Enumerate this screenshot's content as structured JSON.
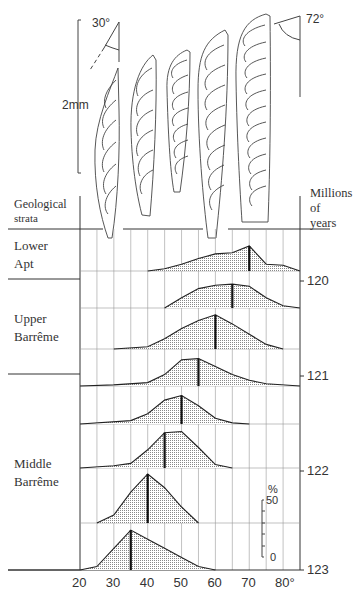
{
  "figure": {
    "scale_bar_label": "2mm",
    "angle_left_label": "30°",
    "angle_right_label": "72°",
    "left_header": [
      "Geological",
      "strata"
    ],
    "right_header": [
      "Millions",
      "of",
      "years"
    ],
    "strata": [
      {
        "name": [
          "Lower",
          "Apt"
        ]
      },
      {
        "name": [
          "Upper",
          "Barrême"
        ]
      },
      {
        "name": [
          "Middle",
          "Barrême"
        ]
      }
    ],
    "shell_count": 5
  },
  "chart_data": {
    "type": "area",
    "title": "",
    "xlabel": "Apical angle (degrees)",
    "ylabel": "Millions of years",
    "x_ticks": [
      "20",
      "30",
      "40",
      "50",
      "60",
      "70",
      "80°"
    ],
    "x_range": [
      20,
      85
    ],
    "grid": true,
    "time_ticks": [
      "120",
      "121",
      "122",
      "123"
    ],
    "percent_scale": {
      "unit": "%",
      "max_label": "50",
      "min_label": "0",
      "max": 50
    },
    "rows": [
      {
        "stratum": "Lower Apt",
        "mean": 70,
        "x": [
          40,
          45,
          50,
          55,
          60,
          65,
          70,
          75,
          80,
          85
        ],
        "pct": [
          0,
          2,
          6,
          11,
          15,
          16,
          22,
          6,
          5,
          0
        ]
      },
      {
        "stratum": "Upper Barrême",
        "mean": 65,
        "x": [
          45,
          50,
          55,
          60,
          65,
          70,
          75,
          80,
          85
        ],
        "pct": [
          0,
          9,
          17,
          20,
          21,
          19,
          9,
          2,
          0
        ]
      },
      {
        "stratum": "Upper Barrême",
        "mean": 60,
        "x": [
          30,
          40,
          45,
          50,
          55,
          60,
          65,
          70,
          75,
          80
        ],
        "pct": [
          0,
          2,
          9,
          18,
          25,
          30,
          22,
          13,
          4,
          0
        ]
      },
      {
        "stratum": "Upper Barrême",
        "mean": 55,
        "x": [
          20,
          30,
          40,
          45,
          50,
          55,
          60,
          65,
          70,
          75,
          85
        ],
        "pct": [
          0,
          1,
          3,
          10,
          23,
          24,
          17,
          10,
          5,
          2,
          0
        ]
      },
      {
        "stratum": "Middle Barrême",
        "mean": 50,
        "x": [
          20,
          35,
          40,
          45,
          50,
          55,
          60,
          65,
          70
        ],
        "pct": [
          0,
          3,
          9,
          21,
          25,
          16,
          5,
          1,
          0
        ]
      },
      {
        "stratum": "Middle Barrême",
        "mean": 45,
        "x": [
          20,
          30,
          35,
          40,
          45,
          50,
          55,
          60,
          65
        ],
        "pct": [
          0,
          2,
          4,
          16,
          31,
          32,
          18,
          3,
          0
        ]
      },
      {
        "stratum": "Middle Barrême",
        "mean": 40,
        "x": [
          25,
          30,
          35,
          40,
          45,
          50,
          55
        ],
        "pct": [
          0,
          7,
          27,
          43,
          31,
          14,
          0
        ]
      },
      {
        "stratum": "Middle Barrême",
        "mean": 35,
        "x": [
          20,
          25,
          30,
          35,
          40,
          45,
          50,
          55,
          60
        ],
        "pct": [
          0,
          3,
          19,
          35,
          27,
          19,
          11,
          3,
          0
        ]
      }
    ]
  }
}
